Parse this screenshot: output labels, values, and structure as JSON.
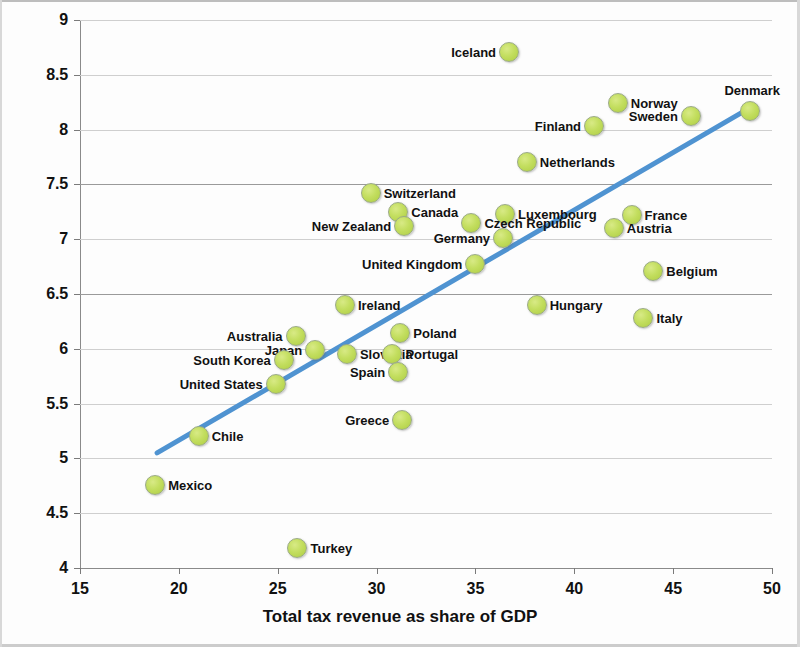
{
  "chart_data": {
    "type": "scatter",
    "title": "",
    "xlabel": "Total tax revenue as share of GDP",
    "ylabel": "Index of Social Justice",
    "xlim": [
      15,
      50
    ],
    "ylim": [
      4,
      9
    ],
    "xticks": [
      "15",
      "20",
      "25",
      "30",
      "35",
      "40",
      "45",
      "50"
    ],
    "yticks": [
      "4",
      "4.5",
      "5",
      "5.5",
      "6",
      "6.5",
      "7",
      "7.5",
      "8",
      "8.5",
      "9"
    ],
    "grid": "horizontal",
    "legend": "none",
    "marker_color": "#c3de5f",
    "marker_edge_color": "#9aaa86",
    "trendline_color": "#4f93d1",
    "trendline": {
      "x0": 18.9,
      "y0": 5.05,
      "x1": 48.9,
      "y1": 8.2
    },
    "points": [
      {
        "label": "Iceland",
        "x": 36.7,
        "y": 8.71,
        "side": "left"
      },
      {
        "label": "Denmark",
        "x": 48.9,
        "y": 8.17,
        "side": "above"
      },
      {
        "label": "Norway",
        "x": 42.2,
        "y": 8.24,
        "side": "right"
      },
      {
        "label": "Sweden",
        "x": 45.9,
        "y": 8.12,
        "side": "left"
      },
      {
        "label": "Finland",
        "x": 41.0,
        "y": 8.03,
        "side": "left"
      },
      {
        "label": "Netherlands",
        "x": 37.6,
        "y": 7.7,
        "side": "right"
      },
      {
        "label": "Switzerland",
        "x": 29.7,
        "y": 7.42,
        "side": "right"
      },
      {
        "label": "Canada",
        "x": 31.1,
        "y": 7.25,
        "side": "right"
      },
      {
        "label": "New Zealand",
        "x": 31.4,
        "y": 7.12,
        "side": "left"
      },
      {
        "label": "Luxembourg",
        "x": 36.5,
        "y": 7.23,
        "side": "right"
      },
      {
        "label": "Czech Republic",
        "x": 34.8,
        "y": 7.15,
        "side": "right"
      },
      {
        "label": "Germany",
        "x": 36.4,
        "y": 7.01,
        "side": "left"
      },
      {
        "label": "France",
        "x": 42.9,
        "y": 7.22,
        "side": "right"
      },
      {
        "label": "Austria",
        "x": 42.0,
        "y": 7.1,
        "side": "right"
      },
      {
        "label": "United Kingdom",
        "x": 35.0,
        "y": 6.77,
        "side": "left"
      },
      {
        "label": "Belgium",
        "x": 44.0,
        "y": 6.71,
        "side": "right"
      },
      {
        "label": "Hungary",
        "x": 38.1,
        "y": 6.4,
        "side": "right"
      },
      {
        "label": "Italy",
        "x": 43.5,
        "y": 6.28,
        "side": "right"
      },
      {
        "label": "Ireland",
        "x": 28.4,
        "y": 6.4,
        "side": "right"
      },
      {
        "label": "Australia",
        "x": 25.9,
        "y": 6.12,
        "side": "left"
      },
      {
        "label": "Japan",
        "x": 26.9,
        "y": 5.99,
        "side": "left"
      },
      {
        "label": "Slovakia",
        "x": 28.5,
        "y": 5.95,
        "side": "right"
      },
      {
        "label": "Poland",
        "x": 31.2,
        "y": 6.14,
        "side": "right"
      },
      {
        "label": "Portugal",
        "x": 30.8,
        "y": 5.95,
        "side": "right"
      },
      {
        "label": "South Korea",
        "x": 25.3,
        "y": 5.9,
        "side": "left"
      },
      {
        "label": "Spain",
        "x": 31.1,
        "y": 5.79,
        "side": "left"
      },
      {
        "label": "United States",
        "x": 24.9,
        "y": 5.68,
        "side": "left"
      },
      {
        "label": "Greece",
        "x": 31.3,
        "y": 5.35,
        "side": "left"
      },
      {
        "label": "Chile",
        "x": 21.0,
        "y": 5.2,
        "side": "right"
      },
      {
        "label": "Mexico",
        "x": 18.8,
        "y": 4.76,
        "side": "right"
      },
      {
        "label": "Turkey",
        "x": 26.0,
        "y": 4.18,
        "side": "right"
      }
    ]
  }
}
